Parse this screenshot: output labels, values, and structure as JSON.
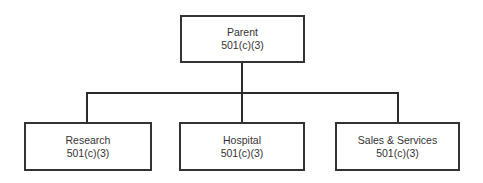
{
  "diagram": {
    "type": "org-chart",
    "parent": {
      "name": "Parent",
      "status": "501(c)(3)"
    },
    "children": [
      {
        "name": "Research",
        "status": "501(c)(3)"
      },
      {
        "name": "Hospital",
        "status": "501(c)(3)"
      },
      {
        "name": "Sales & Services",
        "status": "501(c)(3)"
      }
    ]
  },
  "colors": {
    "line": "#2b2b2b",
    "box_border": "#333333",
    "background": "#ffffff"
  }
}
